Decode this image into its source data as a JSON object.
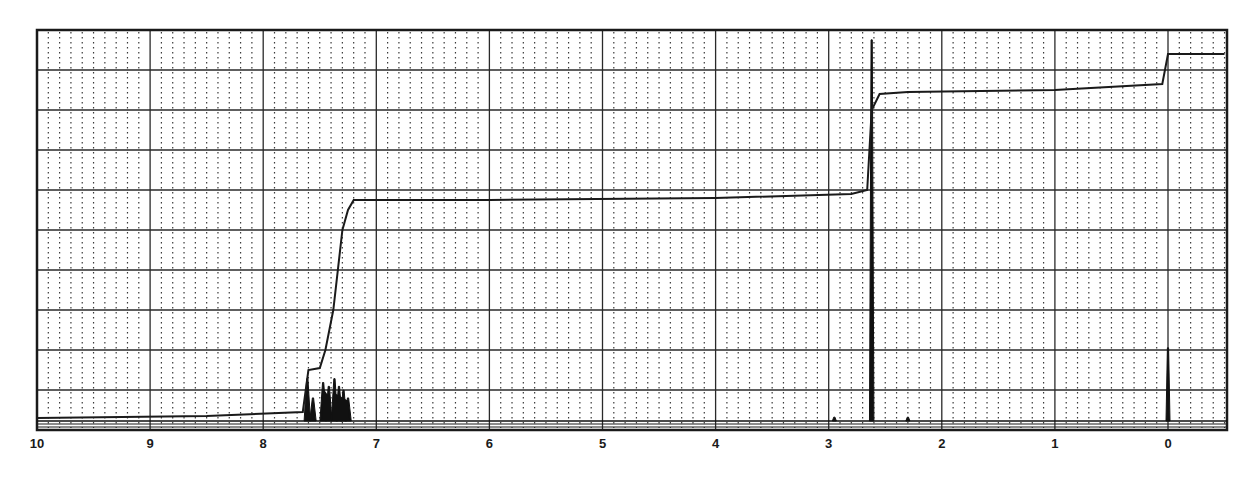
{
  "chart_data": {
    "type": "line",
    "title": "",
    "xlabel": "",
    "ylabel": "",
    "x_axis": {
      "unit": "ppm",
      "direction": "decreasing-left-to-right",
      "range": [
        10,
        -0.5
      ],
      "tick_labels": [
        "10",
        "9",
        "8",
        "7",
        "6",
        "5",
        "4",
        "3",
        "2",
        "1",
        "0"
      ],
      "tick_values": [
        10,
        9,
        8,
        7,
        6,
        5,
        4,
        3,
        2,
        1,
        0
      ]
    },
    "grid": {
      "major_vertical_every_ppm": 1,
      "minor_dotted_every_ppm": 0.1,
      "major_horizontal_rows": 10,
      "on": true
    },
    "series": [
      {
        "name": "spectrum",
        "kind": "peaks",
        "peaks": [
          {
            "ppm": 7.61,
            "rel_height": 0.11,
            "shape": "doublet"
          },
          {
            "ppm": 7.56,
            "rel_height": 0.06
          },
          {
            "ppm": 7.47,
            "rel_height": 0.1,
            "shape": "multiplet"
          },
          {
            "ppm": 7.42,
            "rel_height": 0.09
          },
          {
            "ppm": 7.37,
            "rel_height": 0.11,
            "shape": "multiplet"
          },
          {
            "ppm": 7.33,
            "rel_height": 0.09
          },
          {
            "ppm": 7.29,
            "rel_height": 0.08
          },
          {
            "ppm": 7.25,
            "rel_height": 0.06
          },
          {
            "ppm": 2.62,
            "rel_height": 0.99,
            "shape": "singlet"
          },
          {
            "ppm": 2.95,
            "rel_height": 0.01
          },
          {
            "ppm": 2.3,
            "rel_height": 0.01
          },
          {
            "ppm": 0.0,
            "rel_height": 0.19,
            "shape": "singlet",
            "note": "TMS reference"
          }
        ]
      },
      {
        "name": "integral",
        "kind": "step-curve",
        "points_ppm_vs_fraction": [
          [
            10.0,
            0.03
          ],
          [
            8.5,
            0.035
          ],
          [
            7.65,
            0.045
          ],
          [
            7.6,
            0.15
          ],
          [
            7.5,
            0.155
          ],
          [
            7.45,
            0.2
          ],
          [
            7.38,
            0.3
          ],
          [
            7.3,
            0.5
          ],
          [
            7.25,
            0.55
          ],
          [
            7.2,
            0.575
          ],
          [
            6.0,
            0.575
          ],
          [
            4.0,
            0.58
          ],
          [
            2.8,
            0.59
          ],
          [
            2.66,
            0.6
          ],
          [
            2.62,
            0.8
          ],
          [
            2.55,
            0.84
          ],
          [
            2.3,
            0.845
          ],
          [
            1.0,
            0.85
          ],
          [
            0.05,
            0.865
          ],
          [
            0.0,
            0.94
          ],
          [
            -0.5,
            0.94
          ]
        ]
      }
    ],
    "legend": null,
    "annotations": []
  }
}
